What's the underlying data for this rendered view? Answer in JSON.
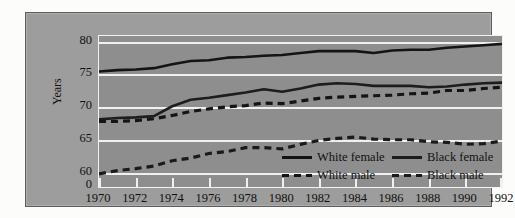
{
  "chart_data": {
    "type": "line",
    "title": "",
    "xlabel": "",
    "ylabel": "Years",
    "x": [
      1970,
      1971,
      1972,
      1973,
      1974,
      1975,
      1976,
      1977,
      1978,
      1979,
      1980,
      1981,
      1982,
      1983,
      1984,
      1985,
      1986,
      1987,
      1988,
      1989,
      1990,
      1991,
      1992
    ],
    "xlim": [
      1970,
      1992
    ],
    "ylim": [
      58,
      81
    ],
    "ytick_labels": [
      "0",
      "60",
      "65",
      "70",
      "75",
      "80"
    ],
    "ytick_values": [
      58,
      60,
      65,
      70,
      75,
      80
    ],
    "xtick_labels": [
      "1970",
      "1972",
      "1974",
      "1976",
      "1978",
      "1980",
      "1982",
      "1984",
      "1986",
      "1988",
      "1990",
      "1992"
    ],
    "grid": "horizontal-white",
    "legend_position": "inside-lower-right",
    "series": [
      {
        "name": "White female",
        "style": "solid",
        "color": "#141414",
        "values": [
          75.6,
          75.8,
          75.9,
          76.1,
          76.7,
          77.2,
          77.3,
          77.7,
          77.8,
          78.0,
          78.1,
          78.4,
          78.7,
          78.7,
          78.7,
          78.4,
          78.8,
          78.9,
          78.9,
          79.2,
          79.4,
          79.6,
          79.8
        ]
      },
      {
        "name": "Black female",
        "style": "solid",
        "color": "#1d1d1d",
        "values": [
          68.3,
          68.5,
          68.6,
          68.8,
          70.3,
          71.3,
          71.6,
          72.0,
          72.4,
          72.9,
          72.5,
          73.0,
          73.6,
          73.8,
          73.7,
          73.4,
          73.4,
          73.4,
          73.2,
          73.3,
          73.6,
          73.8,
          73.9
        ]
      },
      {
        "name": "White male",
        "style": "dashed",
        "color": "#141414",
        "values": [
          68.0,
          68.0,
          68.1,
          68.4,
          68.9,
          69.5,
          69.9,
          70.2,
          70.4,
          70.8,
          70.7,
          71.1,
          71.5,
          71.7,
          71.8,
          71.9,
          72.0,
          72.2,
          72.3,
          72.7,
          72.7,
          73.0,
          73.2
        ]
      },
      {
        "name": "Black male",
        "style": "dashed",
        "color": "#1a1a1a",
        "values": [
          60.0,
          60.5,
          60.8,
          61.2,
          62.0,
          62.4,
          63.1,
          63.4,
          64.0,
          64.0,
          63.8,
          64.5,
          65.1,
          65.4,
          65.6,
          65.3,
          65.2,
          65.2,
          64.9,
          64.8,
          64.5,
          64.6,
          65.0
        ]
      }
    ]
  },
  "legend": {
    "entries": [
      {
        "label": "White female",
        "style": "solid"
      },
      {
        "label": "Black female",
        "style": "solid"
      },
      {
        "label": "White male",
        "style": "dashed"
      },
      {
        "label": "Black male",
        "style": "dashed"
      }
    ]
  },
  "colors": {
    "page_background": "#fcfcfa",
    "frame_background": "#9d9d9d",
    "plot_background": "#8e8e8e",
    "gridline": "#f0f0f0",
    "line": "#141414",
    "text": "#12110f"
  }
}
